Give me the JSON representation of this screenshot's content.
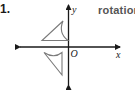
{
  "problem": {
    "number": "1.",
    "answer": "rotation"
  },
  "graph": {
    "x_axis_label": "x",
    "y_axis_label": "y",
    "origin_label": "O",
    "axis_color": "#1a1a1a",
    "shape_color": "#7a7a7a",
    "shapes": [
      {
        "name": "original-figure",
        "description": "triangle with concave arc side, in quadrant II"
      },
      {
        "name": "image-figure",
        "description": "triangle with concave arc side, in quadrant III"
      }
    ]
  }
}
